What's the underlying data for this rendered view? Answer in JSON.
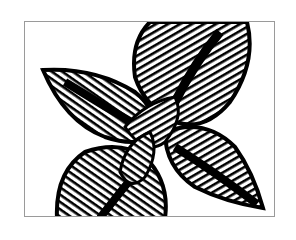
{
  "image": {
    "description": "Black and white illustration of overlapping leaves with dense vein patterns",
    "colors": {
      "ink": "#000000",
      "paper": "#ffffff",
      "frame": "#9a9a9a"
    }
  }
}
